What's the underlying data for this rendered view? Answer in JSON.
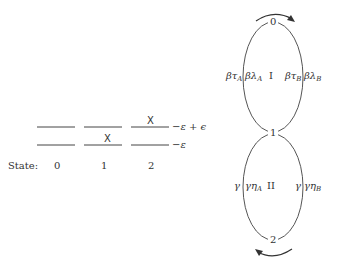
{
  "energy_diagram": {
    "state_label": "State:",
    "states": [
      "0",
      "1",
      "2"
    ],
    "upper_level_label": "−ε + ϵ",
    "lower_level_label": "−ε",
    "marker": "X",
    "occupancy": [
      {
        "state": "0",
        "upper": false,
        "lower": false
      },
      {
        "state": "1",
        "upper": false,
        "lower": true
      },
      {
        "state": "2",
        "upper": true,
        "lower": false
      }
    ]
  },
  "cycle_diagram": {
    "nodes": [
      "0",
      "1",
      "2"
    ],
    "loops": [
      {
        "name": "I",
        "left_outer": "βτ",
        "left_outer_sub": "A",
        "left_inner": "βλ",
        "left_inner_sub": "A",
        "right_inner": "βτ",
        "right_inner_sub": "B",
        "right_outer": "βλ",
        "right_outer_sub": "B",
        "arrow_direction": "clockwise"
      },
      {
        "name": "II",
        "left_outer": "γ",
        "left_outer_sub": "",
        "left_inner": "γη",
        "left_inner_sub": "A",
        "right_inner": "γ",
        "right_inner_sub": "",
        "right_outer": "γη",
        "right_outer_sub": "B",
        "arrow_direction": "clockwise"
      }
    ]
  }
}
